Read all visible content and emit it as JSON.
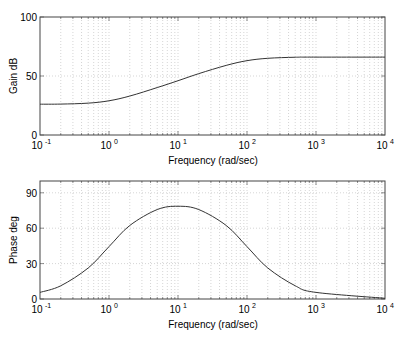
{
  "chart_data": [
    {
      "type": "line",
      "title": "",
      "xlabel": "Frequency (rad/sec)",
      "ylabel": "Gain dB",
      "xscale": "log",
      "xlim": [
        0.1,
        10000
      ],
      "ylim": [
        0,
        100
      ],
      "grid": true,
      "legend": null,
      "xticks": [
        "10^-1",
        "10^0",
        "10^1",
        "10^2",
        "10^3",
        "10^4"
      ],
      "yticks": [
        0,
        50,
        100
      ],
      "series": [
        {
          "name": "Gain",
          "x": [
            0.1,
            0.2,
            0.5,
            1,
            2,
            5,
            10,
            20,
            50,
            100,
            200,
            500,
            1000,
            10000
          ],
          "y": [
            26.1,
            26.2,
            27.0,
            29.0,
            33.0,
            40.2,
            46.0,
            52.0,
            59.0,
            63.0,
            65.0,
            65.9,
            66.0,
            66.0
          ]
        }
      ]
    },
    {
      "type": "line",
      "title": "",
      "xlabel": "Frequency (rad/sec)",
      "ylabel": "Phase deg",
      "xscale": "log",
      "xlim": [
        0.1,
        10000
      ],
      "ylim": [
        0,
        100
      ],
      "grid": true,
      "legend": null,
      "xticks": [
        "10^-1",
        "10^0",
        "10^1",
        "10^2",
        "10^3",
        "10^4"
      ],
      "yticks": [
        0,
        30,
        60,
        90
      ],
      "series": [
        {
          "name": "Phase",
          "x": [
            0.1,
            0.2,
            0.5,
            1,
            2,
            5,
            10,
            20,
            50,
            100,
            200,
            500,
            1000,
            10000
          ],
          "y": [
            5.6,
            11.2,
            26.3,
            44.4,
            62.3,
            75.8,
            78.6,
            75.8,
            62.3,
            44.4,
            26.3,
            11.2,
            5.6,
            0.6
          ]
        }
      ]
    }
  ],
  "plots": {
    "gain": {
      "ylabel": "Gain dB",
      "xlabel": "Frequency (rad/sec)",
      "ytick_labels": [
        "0",
        "50",
        "100"
      ],
      "xtick_bases": [
        "10",
        "10",
        "10",
        "10",
        "10",
        "10"
      ],
      "xtick_exps": [
        "-1",
        "0",
        "1",
        "2",
        "3",
        "4"
      ]
    },
    "phase": {
      "ylabel": "Phase deg",
      "xlabel": "Frequency (rad/sec)",
      "ytick_labels": [
        "0",
        "30",
        "60",
        "90"
      ],
      "xtick_bases": [
        "10",
        "10",
        "10",
        "10",
        "10",
        "10"
      ],
      "xtick_exps": [
        "-1",
        "0",
        "1",
        "2",
        "3",
        "4"
      ]
    }
  },
  "colors": {
    "line": "#333333",
    "axes": "#444444",
    "grid": "#b8b8b8"
  }
}
